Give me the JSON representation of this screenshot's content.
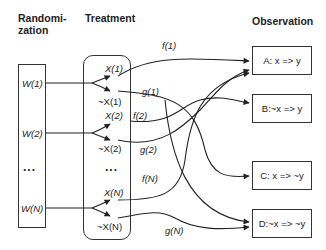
{
  "headings": {
    "randomization": "Randomi-\nzation",
    "randomization_line1": "Randomi-",
    "randomization_line2": "zation",
    "treatment": "Treatment",
    "observation": "Observation"
  },
  "randomization": {
    "items": [
      {
        "label": "W(1)"
      },
      {
        "label": "W(2)"
      },
      {
        "label": "..."
      },
      {
        "label": "W(N)"
      }
    ]
  },
  "treatment": {
    "items": [
      {
        "label": "X(1)"
      },
      {
        "label": "~X(1)"
      },
      {
        "label": "X(2)"
      },
      {
        "label": "~X(2)"
      },
      {
        "label": "..."
      },
      {
        "label": "X(N)"
      },
      {
        "label": "~X(N)"
      }
    ]
  },
  "edges": {
    "labels": [
      {
        "label": "f(1)"
      },
      {
        "label": "g(1)"
      },
      {
        "label": "f(2)"
      },
      {
        "label": "g(2)"
      },
      {
        "label": "f(N)"
      },
      {
        "label": "g(N)"
      }
    ]
  },
  "observation": {
    "items": [
      {
        "id": "A",
        "label": "A: x => y"
      },
      {
        "id": "B",
        "label": "B:~x => y"
      },
      {
        "id": "C",
        "label": "C: x => ~y"
      },
      {
        "id": "D",
        "label": "D:~x => ~y"
      }
    ]
  },
  "colors": {
    "line": "#222222",
    "background": "#ffffff"
  }
}
